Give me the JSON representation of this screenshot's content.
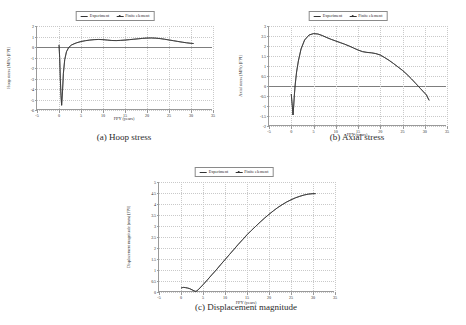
{
  "figure": {
    "legend_entries": [
      "Experiment",
      "Finite element"
    ],
    "x_axis_title": "FPY (years)",
    "captions": {
      "a": "(a) Hoop stress",
      "b": "(b) Axial stress",
      "c": "(c) Displacement magnitude"
    }
  },
  "chart_data": [
    {
      "id": "a",
      "type": "line",
      "title": "(a) Hoop stress",
      "xlabel": "FPY (years)",
      "ylabel": "Hoop stress (MPa) [FPI]",
      "xlim": [
        -5,
        35
      ],
      "ylim": [
        -6.0,
        2.0
      ],
      "xticks": [
        -5,
        0,
        5,
        10,
        15,
        20,
        25,
        30,
        35
      ],
      "yticks": [
        2.0,
        1.0,
        0.0,
        -1.0,
        -2.0,
        -3.0,
        -4.0,
        -5.0,
        -6.0
      ],
      "grid": true,
      "legend_position": "top-center",
      "series": [
        {
          "name": "Experiment",
          "x": [
            0.0,
            0.15,
            0.3,
            0.45,
            0.6,
            0.8,
            1.0,
            1.3,
            1.7,
            2.2,
            2.8,
            3.4,
            4.0,
            5.0,
            6.0,
            7.0,
            8.0,
            9.0,
            10.0,
            11.0,
            12.0,
            13.0,
            14.0,
            15.0,
            16.0,
            17.0,
            18.0,
            19.0,
            20.0,
            21.0,
            22.0,
            23.0,
            24.0,
            25.0,
            26.0,
            27.0,
            28.0,
            29.0,
            30.0,
            30.6
          ],
          "y": [
            0.2,
            -1.0,
            -3.0,
            -4.6,
            -5.55,
            -4.2,
            -2.5,
            -1.2,
            -0.45,
            -0.05,
            0.18,
            0.3,
            0.4,
            0.52,
            0.6,
            0.66,
            0.7,
            0.72,
            0.7,
            0.66,
            0.62,
            0.61,
            0.63,
            0.66,
            0.7,
            0.74,
            0.78,
            0.82,
            0.85,
            0.86,
            0.84,
            0.8,
            0.74,
            0.67,
            0.6,
            0.53,
            0.46,
            0.4,
            0.35,
            0.33
          ]
        },
        {
          "name": "Finite element",
          "x": [
            0.0,
            0.15,
            0.3,
            0.45,
            0.6,
            0.8,
            1.0,
            1.3,
            1.7,
            2.2,
            2.8,
            3.4,
            4.0,
            5.0,
            6.0,
            7.0,
            8.0,
            9.0,
            10.0,
            11.0,
            12.0,
            13.0,
            14.0,
            15.0,
            16.0,
            17.0,
            18.0,
            19.0,
            20.0,
            21.0,
            22.0,
            23.0,
            24.0,
            25.0,
            26.0,
            27.0,
            28.0,
            29.0,
            30.0,
            30.6
          ],
          "y": [
            0.2,
            -1.0,
            -3.0,
            -4.6,
            -5.55,
            -4.2,
            -2.5,
            -1.2,
            -0.45,
            -0.05,
            0.18,
            0.3,
            0.4,
            0.52,
            0.6,
            0.66,
            0.7,
            0.72,
            0.7,
            0.66,
            0.62,
            0.61,
            0.63,
            0.66,
            0.7,
            0.74,
            0.78,
            0.82,
            0.85,
            0.86,
            0.84,
            0.8,
            0.74,
            0.67,
            0.6,
            0.53,
            0.46,
            0.4,
            0.35,
            0.33
          ]
        }
      ]
    },
    {
      "id": "b",
      "type": "line",
      "title": "(b) Axial stress",
      "xlabel": "FPY (years)",
      "ylabel": "Axial stress (MPa) [FPI]",
      "xlim": [
        -5,
        35
      ],
      "ylim": [
        -2.0,
        3.0
      ],
      "xticks": [
        -5,
        0,
        5,
        10,
        15,
        20,
        25,
        30,
        35
      ],
      "yticks": [
        3.0,
        2.5,
        2.0,
        1.5,
        1.0,
        0.5,
        0.0,
        -0.5,
        -1.0,
        -1.5,
        -2.0
      ],
      "grid": true,
      "legend_position": "top-center",
      "series": [
        {
          "name": "Experiment",
          "x": [
            0.0,
            0.2,
            0.4,
            0.55,
            0.7,
            0.9,
            1.2,
            1.6,
            2.2,
            3.0,
            4.0,
            5.0,
            6.0,
            7.0,
            8.0,
            9.0,
            10.0,
            11.0,
            12.0,
            13.0,
            14.0,
            15.0,
            16.0,
            17.0,
            18.0,
            19.0,
            20.0,
            21.0,
            22.0,
            23.0,
            24.0,
            25.0,
            26.0,
            27.0,
            28.0,
            29.0,
            30.0,
            30.4,
            30.6,
            31.0
          ],
          "y": [
            -0.4,
            -0.9,
            -1.45,
            -1.0,
            -0.45,
            0.1,
            0.7,
            1.25,
            1.85,
            2.3,
            2.55,
            2.62,
            2.6,
            2.52,
            2.42,
            2.33,
            2.25,
            2.17,
            2.09,
            2.0,
            1.9,
            1.8,
            1.72,
            1.68,
            1.66,
            1.62,
            1.55,
            1.42,
            1.28,
            1.12,
            0.95,
            0.78,
            0.58,
            0.36,
            0.12,
            -0.12,
            -0.36,
            -0.45,
            -0.55,
            -0.72
          ]
        },
        {
          "name": "Finite element",
          "x": [
            0.0,
            0.2,
            0.4,
            0.55,
            0.7,
            0.9,
            1.2,
            1.6,
            2.2,
            3.0,
            4.0,
            5.0,
            6.0,
            7.0,
            8.0,
            9.0,
            10.0,
            11.0,
            12.0,
            13.0,
            14.0,
            15.0,
            16.0,
            17.0,
            18.0,
            19.0,
            20.0,
            21.0,
            22.0,
            23.0,
            24.0,
            25.0,
            26.0,
            27.0,
            28.0,
            29.0,
            30.0,
            30.4,
            30.6,
            31.0
          ],
          "y": [
            -0.4,
            -0.9,
            -1.45,
            -1.0,
            -0.45,
            0.1,
            0.7,
            1.25,
            1.85,
            2.3,
            2.55,
            2.62,
            2.6,
            2.52,
            2.42,
            2.33,
            2.25,
            2.17,
            2.09,
            2.0,
            1.9,
            1.8,
            1.72,
            1.68,
            1.66,
            1.62,
            1.55,
            1.42,
            1.28,
            1.12,
            0.95,
            0.78,
            0.58,
            0.36,
            0.12,
            -0.12,
            -0.36,
            -0.45,
            -0.55,
            -0.72
          ]
        }
      ]
    },
    {
      "id": "c",
      "type": "line",
      "title": "(c) Displacement magnitude",
      "xlabel": "FPY (years)",
      "ylabel": "Displacement magnitude (mm) [FPI]",
      "xlim": [
        -5,
        35
      ],
      "ylim": [
        0.0,
        5.0
      ],
      "xticks": [
        -5,
        0,
        5,
        10,
        15,
        20,
        25,
        30,
        35
      ],
      "yticks": [
        5.0,
        4.5,
        4.0,
        3.5,
        3.0,
        2.5,
        2.0,
        1.5,
        1.0,
        0.5,
        0.0
      ],
      "grid": true,
      "legend_position": "top-center",
      "series": [
        {
          "name": "Experiment",
          "x": [
            0.0,
            0.3,
            0.6,
            1.0,
            1.5,
            2.0,
            2.5,
            3.0,
            3.3,
            3.6,
            4.0,
            5.0,
            6.0,
            7.0,
            8.0,
            9.0,
            10.0,
            11.0,
            12.0,
            13.0,
            14.0,
            15.0,
            16.0,
            17.0,
            18.0,
            19.0,
            20.0,
            21.0,
            22.0,
            23.0,
            24.0,
            25.0,
            26.0,
            27.0,
            28.0,
            29.0,
            30.0,
            30.6
          ],
          "y": [
            0.18,
            0.2,
            0.21,
            0.2,
            0.18,
            0.15,
            0.1,
            0.05,
            0.03,
            0.05,
            0.12,
            0.33,
            0.55,
            0.78,
            1.0,
            1.24,
            1.47,
            1.7,
            1.93,
            2.16,
            2.38,
            2.6,
            2.8,
            2.99,
            3.18,
            3.36,
            3.53,
            3.69,
            3.84,
            3.97,
            4.09,
            4.19,
            4.28,
            4.35,
            4.41,
            4.45,
            4.47,
            4.47
          ]
        },
        {
          "name": "Finite element",
          "x": [
            0.0,
            0.3,
            0.6,
            1.0,
            1.5,
            2.0,
            2.5,
            3.0,
            3.3,
            3.6,
            4.0,
            5.0,
            6.0,
            7.0,
            8.0,
            9.0,
            10.0,
            11.0,
            12.0,
            13.0,
            14.0,
            15.0,
            16.0,
            17.0,
            18.0,
            19.0,
            20.0,
            21.0,
            22.0,
            23.0,
            24.0,
            25.0,
            26.0,
            27.0,
            28.0,
            29.0,
            30.0,
            30.6
          ],
          "y": [
            0.18,
            0.2,
            0.21,
            0.2,
            0.18,
            0.15,
            0.1,
            0.05,
            0.03,
            0.05,
            0.12,
            0.33,
            0.55,
            0.78,
            1.0,
            1.24,
            1.47,
            1.7,
            1.93,
            2.16,
            2.38,
            2.6,
            2.8,
            2.99,
            3.18,
            3.36,
            3.53,
            3.69,
            3.84,
            3.97,
            4.09,
            4.19,
            4.28,
            4.35,
            4.41,
            4.45,
            4.47,
            4.47
          ]
        }
      ]
    }
  ]
}
